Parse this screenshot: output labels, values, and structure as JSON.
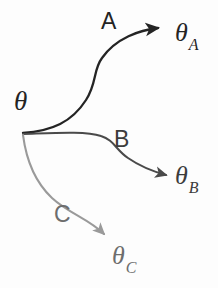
{
  "diagram": {
    "type": "branching-arrow-diagram",
    "background_color": "#fdfdfd",
    "source": {
      "label": "θ",
      "color": "#232323"
    },
    "branches": [
      {
        "id": "A",
        "label": "A",
        "target_symbol": "θ",
        "target_subscript": "A",
        "color": "#242424",
        "stroke_width": 2.2,
        "direction": "upper-right"
      },
      {
        "id": "B",
        "label": "B",
        "target_symbol": "θ",
        "target_subscript": "B",
        "color": "#4a4a4a",
        "stroke_width": 2.0,
        "direction": "right"
      },
      {
        "id": "C",
        "label": "C",
        "target_symbol": "θ",
        "target_subscript": "C",
        "color": "#9a9a9a",
        "stroke_width": 2.0,
        "direction": "lower-right"
      }
    ]
  },
  "paths": {
    "branch_a": "M 23,133 C 52,131 72,122 86,100 C 97,83 93,70 102,58 C 116,38 140,30 158,28",
    "branch_b": "M 23,134 C 55,133 86,131 101,136 C 114,140 116,150 128,158 C 141,167 155,172 166,175",
    "branch_c": "M 23,135 C 26,158 35,182 52,198 C 68,213 89,219 104,234"
  },
  "arrowheads": {
    "a": {
      "x": 168,
      "y": 27,
      "angle": -8
    },
    "b": {
      "x": 176,
      "y": 177,
      "angle": 18
    },
    "c": {
      "x": 110,
      "y": 242,
      "angle": 62
    }
  }
}
